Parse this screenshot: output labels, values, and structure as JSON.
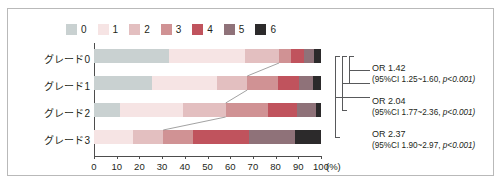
{
  "chart_data": {
    "type": "bar",
    "orientation": "horizontal",
    "stacked": true,
    "stack_mode": "percent",
    "title": "",
    "xlabel": "(%)",
    "ylabel": "",
    "xlim": [
      0,
      100
    ],
    "xticks": [
      0,
      10,
      20,
      30,
      40,
      50,
      60,
      70,
      80,
      90,
      100
    ],
    "grid": false,
    "legend_position": "top",
    "legend_title": "",
    "categories": [
      "グレード0",
      "グレード1",
      "グレード2",
      "グレード3"
    ],
    "series": [
      {
        "name": "0",
        "color": "#c9d1d1",
        "values": [
          33.0,
          25.5,
          11.5,
          0.0
        ]
      },
      {
        "name": "1",
        "color": "#f6e4e4",
        "values": [
          33.5,
          28.5,
          27.5,
          17.0
        ]
      },
      {
        "name": "2",
        "color": "#e3bfc0",
        "values": [
          15.0,
          13.5,
          19.0,
          13.5
        ]
      },
      {
        "name": "3",
        "color": "#d09294",
        "values": [
          5.5,
          13.5,
          18.5,
          13.0
        ]
      },
      {
        "name": "4",
        "color": "#c0535d",
        "values": [
          5.5,
          9.5,
          13.0,
          25.0
        ]
      },
      {
        "name": "5",
        "color": "#8f7279",
        "values": [
          4.5,
          6.0,
          8.5,
          20.0
        ]
      },
      {
        "name": "6",
        "color": "#2c2a2b",
        "values": [
          3.0,
          3.5,
          2.0,
          11.5
        ]
      }
    ],
    "annotations": [
      {
        "id": "or-1",
        "or_label": "OR 1.42",
        "ci_label": "(95%CI 1.25~1.60,",
        "p_label": "p<0.001)",
        "spans": [
          "グレード0",
          "グレード1"
        ]
      },
      {
        "id": "or-2",
        "or_label": "OR 2.04",
        "ci_label": "(95%CI 1.77~2.36,",
        "p_label": "p<0.001)",
        "spans": [
          "グレード0",
          "グレード2"
        ]
      },
      {
        "id": "or-3",
        "or_label": "OR 2.37",
        "ci_label": "(95%CI 1.90~2.97,",
        "p_label": "p<0.001)",
        "spans": [
          "グレード0",
          "グレード3"
        ]
      }
    ]
  },
  "legend": {
    "items": [
      {
        "label": "0",
        "color": "#c9d1d1"
      },
      {
        "label": "1",
        "color": "#f6e4e4"
      },
      {
        "label": "2",
        "color": "#e3bfc0"
      },
      {
        "label": "3",
        "color": "#d09294"
      },
      {
        "label": "4",
        "color": "#c0535d"
      },
      {
        "label": "5",
        "color": "#8f7279"
      },
      {
        "label": "6",
        "color": "#2c2a2b"
      }
    ]
  },
  "axis": {
    "x_tick_labels": [
      "0",
      "10",
      "20",
      "30",
      "40",
      "50",
      "60",
      "70",
      "80",
      "90",
      "100"
    ],
    "x_unit": "(%)"
  },
  "rows": [
    {
      "label": "グレード0"
    },
    {
      "label": "グレード1"
    },
    {
      "label": "グレード2"
    },
    {
      "label": "グレード3"
    }
  ],
  "annotations": [
    {
      "or": "OR 1.42",
      "ci": "(95%CI 1.25~1.60,",
      "p": "p<0.001)"
    },
    {
      "or": "OR 2.04",
      "ci": "(95%CI 1.77~2.36,",
      "p": "p<0.001)"
    },
    {
      "or": "OR 2.37",
      "ci": "(95%CI 1.90~2.97,",
      "p": "p<0.001)"
    }
  ]
}
